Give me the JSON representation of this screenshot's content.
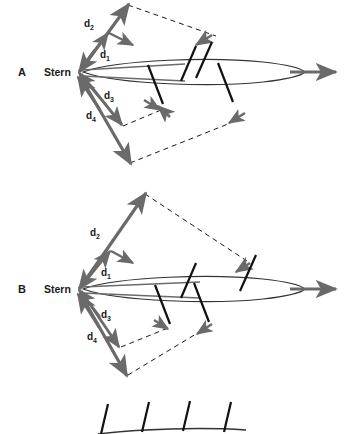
{
  "figure": {
    "title": "",
    "background_color": "#ffffff",
    "vector_color": "#6a6a6a",
    "ray_color": "#111111",
    "body_outline_color": "#333333",
    "dashed_color": "#1a1a1a",
    "text_color": "#1a1a1a"
  },
  "panels": [
    {
      "id": "A",
      "label": "A",
      "origin_label": "Stern",
      "vectors": [
        {
          "name": "d1",
          "label": "d",
          "subscript": "1"
        },
        {
          "name": "d2",
          "label": "d",
          "subscript": "2"
        },
        {
          "name": "d3",
          "label": "d",
          "subscript": "3"
        },
        {
          "name": "d4",
          "label": "d",
          "subscript": "4"
        }
      ]
    },
    {
      "id": "B",
      "label": "B",
      "origin_label": "Stern",
      "vectors": [
        {
          "name": "d1",
          "label": "d",
          "subscript": "1"
        },
        {
          "name": "d2",
          "label": "d",
          "subscript": "2"
        },
        {
          "name": "d3",
          "label": "d",
          "subscript": "3"
        },
        {
          "name": "d4",
          "label": "d",
          "subscript": "4"
        }
      ]
    }
  ],
  "legend": {
    "name": "fin-ray-key",
    "ray_count": 4
  }
}
